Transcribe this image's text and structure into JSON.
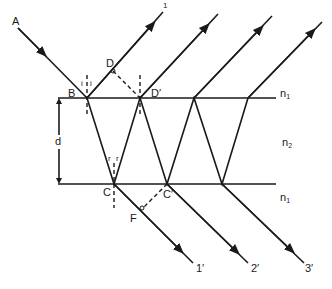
{
  "diagram": {
    "colors": {
      "ink": "#1a1a1a",
      "background": "#ffffff"
    },
    "points": {
      "A": "A",
      "B": "B",
      "C": "C",
      "D": "D",
      "D_prime": "D′",
      "C_prime": "C′",
      "F": "F"
    },
    "media": {
      "top": {
        "label": "n",
        "sub": "1"
      },
      "middle": {
        "label": "n",
        "sub": "2"
      },
      "bottom": {
        "label": "n",
        "sub": "1"
      }
    },
    "thickness_label": "d",
    "angle_labels": {
      "incidence_left": "i",
      "incidence_right": "i",
      "refraction_left": "r",
      "refraction_right": "r"
    },
    "reflected_ray_top_label": "1",
    "transmitted_rays": [
      "1′",
      "2′",
      "3′"
    ]
  }
}
